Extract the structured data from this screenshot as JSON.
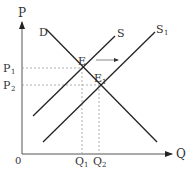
{
  "diagram": {
    "type": "supply-demand-shift",
    "axes": {
      "y_label": "P",
      "x_label": "Q",
      "origin_label": "0"
    },
    "curves": {
      "demand": "D",
      "supply": "S",
      "supply_shifted": "S",
      "supply_shifted_sub": "1"
    },
    "points": {
      "equilibrium": "E",
      "equilibrium_new": "E",
      "equilibrium_new_sub": "1"
    },
    "price_ticks": [
      {
        "label": "P",
        "sub": "1"
      },
      {
        "label": "P",
        "sub": "2"
      }
    ],
    "quantity_ticks": [
      {
        "label": "Q",
        "sub": "1"
      },
      {
        "label": "Q",
        "sub": "2"
      }
    ],
    "colors": {
      "line": "#222222",
      "guide": "#999999",
      "text": "#333333"
    }
  }
}
